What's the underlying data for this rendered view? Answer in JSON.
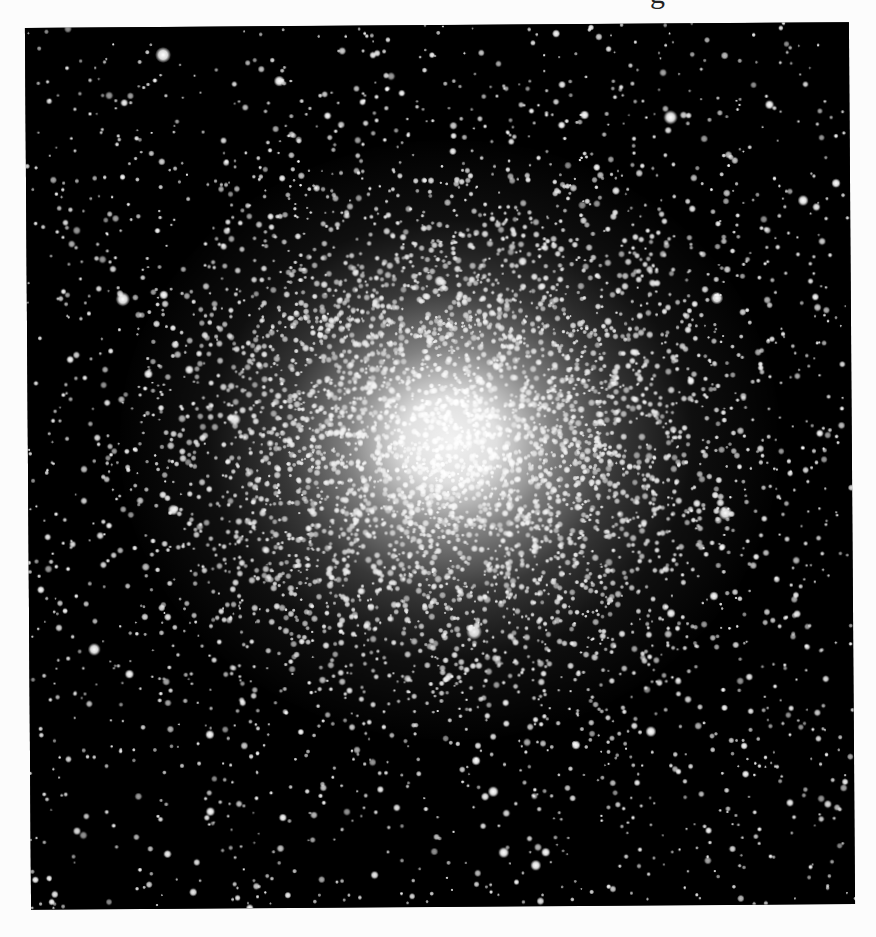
{
  "page": {
    "heading_fragment": "g",
    "background_color": "#fcfcfc"
  },
  "image": {
    "subject": "globular star cluster",
    "description": "Black-and-white telescope photograph of a dense globular cluster with a bright, saturated core surrounded by a halo of resolved stars and a sparse field of foreground stars",
    "frame": {
      "top_left": [
        25,
        31
      ],
      "top_right": [
        847,
        21
      ],
      "bottom_left": [
        32,
        911
      ],
      "bottom_right": [
        854,
        902
      ],
      "background_color": "#000000"
    },
    "core_center": [
      450,
      440
    ],
    "core_radius_px": 90,
    "halo_radius_px": 300,
    "star_color": "#ffffff",
    "bright_stars": [
      {
        "x": 166,
        "y": 53,
        "r": 5
      },
      {
        "x": 282,
        "y": 80,
        "r": 3.5
      },
      {
        "x": 673,
        "y": 119,
        "r": 4.5
      },
      {
        "x": 772,
        "y": 107,
        "r": 3
      },
      {
        "x": 805,
        "y": 203,
        "r": 3.5
      },
      {
        "x": 838,
        "y": 186,
        "r": 3
      },
      {
        "x": 718,
        "y": 300,
        "r": 4
      },
      {
        "x": 124,
        "y": 297,
        "r": 4.5
      },
      {
        "x": 165,
        "y": 293,
        "r": 3
      },
      {
        "x": 190,
        "y": 368,
        "r": 3
      },
      {
        "x": 235,
        "y": 418,
        "r": 4
      },
      {
        "x": 173,
        "y": 508,
        "r": 3.5
      },
      {
        "x": 149,
        "y": 372,
        "r": 3
      },
      {
        "x": 473,
        "y": 632,
        "r": 5
      },
      {
        "x": 725,
        "y": 515,
        "r": 4.5
      },
      {
        "x": 649,
        "y": 733,
        "r": 3.5
      },
      {
        "x": 670,
        "y": 615,
        "r": 3
      },
      {
        "x": 713,
        "y": 598,
        "r": 3
      },
      {
        "x": 93,
        "y": 647,
        "r": 4
      },
      {
        "x": 128,
        "y": 672,
        "r": 3
      },
      {
        "x": 208,
        "y": 733,
        "r": 3
      },
      {
        "x": 208,
        "y": 810,
        "r": 3
      },
      {
        "x": 533,
        "y": 866,
        "r": 3.5
      },
      {
        "x": 543,
        "y": 853,
        "r": 3
      },
      {
        "x": 501,
        "y": 853,
        "r": 3.5
      },
      {
        "x": 474,
        "y": 761,
        "r": 3
      },
      {
        "x": 491,
        "y": 792,
        "r": 3.5
      },
      {
        "x": 574,
        "y": 746,
        "r": 3
      },
      {
        "x": 441,
        "y": 281,
        "r": 3.5
      },
      {
        "x": 524,
        "y": 262,
        "r": 3
      },
      {
        "x": 587,
        "y": 116,
        "r": 3
      },
      {
        "x": 564,
        "y": 126,
        "r": 2.5
      },
      {
        "x": 330,
        "y": 115,
        "r": 2.5
      },
      {
        "x": 71,
        "y": 357,
        "r": 2.5
      },
      {
        "x": 40,
        "y": 587,
        "r": 2.5
      },
      {
        "x": 820,
        "y": 436,
        "r": 2.5
      }
    ],
    "field_star_count": 1900,
    "cluster_star_count": 4200,
    "random_seed": 7
  }
}
